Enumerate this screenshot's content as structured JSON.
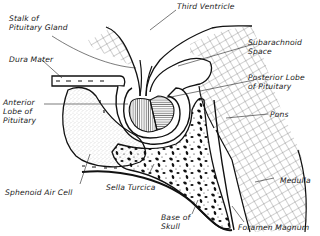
{
  "diagram": {
    "colors": {
      "ink": "#111111",
      "background": "#ffffff",
      "stipple": "#555555"
    },
    "labels": [
      {
        "id": "third-ventricle",
        "text": "Third Ventricle"
      },
      {
        "id": "stalk",
        "text": "Stalk of\nPituitary Gland"
      },
      {
        "id": "subarachnoid",
        "text": "Subarachnoid\nSpace"
      },
      {
        "id": "dura",
        "text": "Dura Mater"
      },
      {
        "id": "posterior-lobe",
        "text": "Posterior Lobe\nof Pituitary"
      },
      {
        "id": "anterior-lobe",
        "text": "Anterior\nLobe of\nPituitary"
      },
      {
        "id": "pons",
        "text": "Pons"
      },
      {
        "id": "sphenoid",
        "text": "Sphenoid Air Cell"
      },
      {
        "id": "sella",
        "text": "Sella Turcica"
      },
      {
        "id": "medulla",
        "text": "Medulla"
      },
      {
        "id": "base-skull",
        "text": "Base of\nSkull"
      },
      {
        "id": "foramen",
        "text": "Foramen Magnum"
      }
    ]
  }
}
